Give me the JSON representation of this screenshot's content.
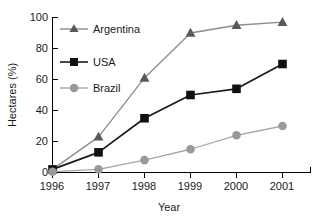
{
  "chart_data": {
    "type": "line",
    "title": "",
    "xlabel": "Year",
    "ylabel": "Hectares (%)",
    "categories": [
      "1996",
      "1997",
      "1998",
      "1999",
      "2000",
      "2001"
    ],
    "x": [
      1996,
      1997,
      1998,
      1999,
      2000,
      2001
    ],
    "xlim": [
      1996,
      2001.6
    ],
    "ylim": [
      0,
      100
    ],
    "yticks": [
      0,
      20,
      40,
      60,
      80,
      100
    ],
    "ytick_labels": [
      "0",
      "20",
      "40",
      "60",
      "80",
      "100"
    ],
    "xtick_labels": [
      "1996",
      "1997",
      "1998",
      "1999",
      "2000",
      "2001"
    ],
    "grid": false,
    "legend_position": "upper-left-inside",
    "series": [
      {
        "name": "Argentina",
        "values": [
          2,
          23,
          61,
          90,
          95,
          97
        ],
        "marker": "triangle",
        "line_color": "#8c8c8c",
        "marker_color": "#595959"
      },
      {
        "name": "USA",
        "values": [
          2,
          13,
          35,
          50,
          54,
          70
        ],
        "marker": "square",
        "line_color": "#1a1a1a",
        "marker_color": "#111111"
      },
      {
        "name": "Brazil",
        "values": [
          0.5,
          2,
          8,
          15,
          24,
          30
        ],
        "marker": "circle",
        "line_color": "#a6a6a6",
        "marker_color": "#999999"
      }
    ]
  },
  "axes": {
    "y_axis_title": "Hectares (%)",
    "x_axis_title": "Year"
  },
  "legend": {
    "entries": [
      {
        "label": "Argentina"
      },
      {
        "label": "USA"
      },
      {
        "label": "Brazil"
      }
    ]
  },
  "colors": {
    "axis": "#000000",
    "text": "#1a1a1a",
    "background": "#ffffff"
  }
}
